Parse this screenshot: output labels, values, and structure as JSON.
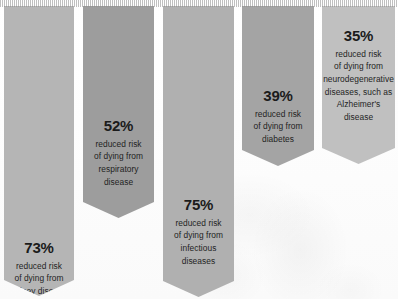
{
  "figure": {
    "type": "infographic-bars",
    "background_color": "#fdfdfd",
    "orientation": "downward-pointing-arrow-bars"
  },
  "chart_data": {
    "type": "bar",
    "title": "",
    "xlabel": "",
    "ylabel": "",
    "categories": [
      "kidney disease",
      "respiratory disease",
      "infectious diseases",
      "diabetes",
      "neurodegenerative diseases, such as Alzheimer's disease"
    ],
    "values": [
      73,
      52,
      75,
      39,
      35
    ],
    "value_unit": "%",
    "value_meaning": "reduced risk of dying from",
    "ylim": [
      0,
      100
    ],
    "grid": false,
    "legend": "none"
  },
  "bars": [
    {
      "pct": "73%",
      "value": 73,
      "desc_lines": [
        "reduced risk",
        "of dying from",
        "kidney disease"
      ],
      "color": "#b5b5b5",
      "x": 4,
      "width": 70,
      "height": 290,
      "text_top": 240
    },
    {
      "pct": "52%",
      "value": 52,
      "desc_lines": [
        "reduced risk",
        "of dying from",
        "respiratory",
        "disease"
      ],
      "color": "#9d9d9d",
      "x": 83,
      "width": 71,
      "height": 212,
      "text_top": 118
    },
    {
      "pct": "75%",
      "value": 75,
      "desc_lines": [
        "reduced risk",
        "of dying from",
        "infectious",
        "diseases"
      ],
      "color": "#b0b0b0",
      "x": 163,
      "width": 71,
      "height": 291,
      "text_top": 197
    },
    {
      "pct": "39%",
      "value": 39,
      "desc_lines": [
        "reduced risk",
        "of dying from",
        "diabetes"
      ],
      "color": "#a4a4a4",
      "x": 242,
      "width": 72,
      "height": 160,
      "text_top": 88
    },
    {
      "pct": "35%",
      "value": 35,
      "desc_lines": [
        "reduced risk",
        "of dying from",
        "neurodegenerative",
        "diseases, such as",
        "Alzheimer's",
        "disease"
      ],
      "color": "#c0c0c0",
      "x": 322,
      "width": 73,
      "height": 158,
      "text_top": 28
    }
  ]
}
